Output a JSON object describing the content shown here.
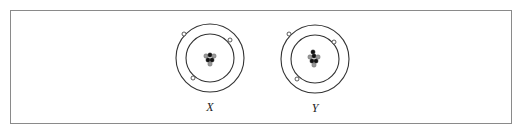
{
  "figure": {
    "frame": {
      "x": 10,
      "y": 10,
      "width": 502,
      "height": 114,
      "border_color": "#8a8a8a"
    },
    "atoms": [
      {
        "label": "X",
        "center": [
          210,
          58
        ],
        "shells": [
          {
            "radius": 24
          },
          {
            "radius": 34
          }
        ],
        "electrons": [
          {
            "shell": 2,
            "x": 184,
            "y": 34
          },
          {
            "shell": 1,
            "x": 230,
            "y": 40
          },
          {
            "shell": 1,
            "x": 193,
            "y": 78
          }
        ],
        "nucleus": [
          {
            "x": 206,
            "y": 56,
            "type": "neutron"
          },
          {
            "x": 210,
            "y": 55,
            "type": "proton"
          },
          {
            "x": 214,
            "y": 56,
            "type": "neutron"
          },
          {
            "x": 208,
            "y": 60,
            "type": "proton"
          },
          {
            "x": 212,
            "y": 60,
            "type": "proton"
          },
          {
            "x": 210,
            "y": 64,
            "type": "neutron"
          }
        ]
      },
      {
        "label": "Y",
        "center": [
          315,
          59
        ],
        "shells": [
          {
            "radius": 24
          },
          {
            "radius": 34
          }
        ],
        "electrons": [
          {
            "shell": 2,
            "x": 289,
            "y": 34
          },
          {
            "shell": 1,
            "x": 334,
            "y": 42
          },
          {
            "shell": 1,
            "x": 297,
            "y": 79
          }
        ],
        "nucleus": [
          {
            "x": 313,
            "y": 52,
            "type": "proton"
          },
          {
            "x": 310,
            "y": 57,
            "type": "neutron"
          },
          {
            "x": 314,
            "y": 56,
            "type": "proton"
          },
          {
            "x": 318,
            "y": 57,
            "type": "neutron"
          },
          {
            "x": 312,
            "y": 61,
            "type": "proton"
          },
          {
            "x": 316,
            "y": 61,
            "type": "proton"
          },
          {
            "x": 314,
            "y": 65,
            "type": "neutron"
          }
        ]
      }
    ],
    "labels": [
      {
        "text": "X",
        "x": 210,
        "y": 111
      },
      {
        "text": "Y",
        "x": 315,
        "y": 112
      }
    ],
    "colors": {
      "line": "#333333",
      "proton": "#111111",
      "neutron": "#9a9a9a",
      "electron_fill": "#ffffff"
    }
  }
}
